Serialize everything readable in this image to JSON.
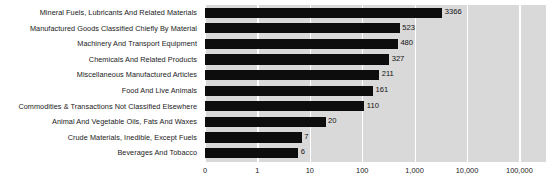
{
  "chart": {
    "type": "bar",
    "orientation": "horizontal",
    "x_scale": "log",
    "background_color": "#d9d9d9",
    "bar_color": "#0d0d0d",
    "gridline_color": "#ffffff"
  },
  "chart_data": {
    "type": "bar",
    "title": "",
    "xlabel": "",
    "ylabel": "",
    "orientation": "horizontal",
    "xscale": "log",
    "grid": true,
    "legend": false,
    "xticks": [
      "0",
      "1",
      "10",
      "100",
      "1,000",
      "10,000",
      "100,000"
    ],
    "xtick_values": [
      0,
      1,
      10,
      100,
      1000,
      10000,
      100000
    ],
    "xlim": [
      0,
      100000
    ],
    "categories": [
      "Mineral Fuels, Lubricants And Related Materials",
      "Manufactured Goods Classified Chiefly By Material",
      "Machinery And Transport Equipment",
      "Chemicals And Related Products",
      "Miscellaneous Manufactured Articles",
      "Food And Live Animals",
      "Commodities & Transactions Not Classified Elsewhere",
      "Animal And Vegetable Oils, Fats And Waxes",
      "Crude Materials, Inedible, Except Fuels",
      "Beverages And Tobacco"
    ],
    "values": [
      3366,
      523,
      480,
      327,
      211,
      161,
      110,
      20,
      7,
      6
    ],
    "value_labels": [
      "3366",
      "523",
      "480",
      "327",
      "211",
      "161",
      "110",
      "20",
      "7",
      "6"
    ]
  }
}
